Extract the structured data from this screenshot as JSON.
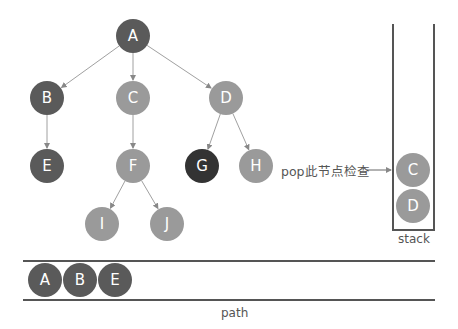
{
  "colors": {
    "visited": "#5a5a5a",
    "current": "#333333",
    "unvisited": "#9a9a9a",
    "edge": "#a0a0a0",
    "container": "#555555",
    "text": "#555555"
  },
  "tree": {
    "nodes": [
      {
        "id": "A",
        "label": "A",
        "x": 133,
        "y": 36,
        "state": "visited"
      },
      {
        "id": "B",
        "label": "B",
        "x": 47,
        "y": 98,
        "state": "visited"
      },
      {
        "id": "C",
        "label": "C",
        "x": 133,
        "y": 98,
        "state": "unvisited"
      },
      {
        "id": "D",
        "label": "D",
        "x": 226,
        "y": 98,
        "state": "unvisited"
      },
      {
        "id": "E",
        "label": "E",
        "x": 47,
        "y": 166,
        "state": "visited"
      },
      {
        "id": "F",
        "label": "F",
        "x": 133,
        "y": 166,
        "state": "unvisited"
      },
      {
        "id": "G",
        "label": "G",
        "x": 202,
        "y": 166,
        "state": "current"
      },
      {
        "id": "H",
        "label": "H",
        "x": 256,
        "y": 166,
        "state": "unvisited"
      },
      {
        "id": "I",
        "label": "I",
        "x": 102,
        "y": 224,
        "state": "unvisited"
      },
      {
        "id": "J",
        "label": "J",
        "x": 167,
        "y": 224,
        "state": "unvisited"
      }
    ],
    "edges": [
      [
        "A",
        "B"
      ],
      [
        "A",
        "C"
      ],
      [
        "A",
        "D"
      ],
      [
        "B",
        "E"
      ],
      [
        "C",
        "F"
      ],
      [
        "D",
        "G"
      ],
      [
        "D",
        "H"
      ],
      [
        "F",
        "I"
      ],
      [
        "F",
        "J"
      ]
    ]
  },
  "annotation": {
    "text": "pop此节点检查",
    "x": 281,
    "y": 170
  },
  "stack": {
    "label": "stack",
    "items": [
      {
        "label": "C",
        "state": "unvisited"
      },
      {
        "label": "D",
        "state": "unvisited"
      }
    ]
  },
  "path": {
    "label": "path",
    "items": [
      {
        "label": "A",
        "state": "visited"
      },
      {
        "label": "B",
        "state": "visited"
      },
      {
        "label": "E",
        "state": "visited"
      }
    ]
  }
}
